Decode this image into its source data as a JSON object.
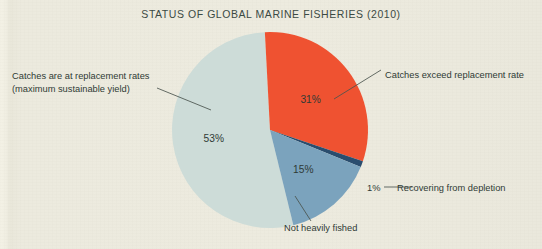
{
  "figure": {
    "title": "STATUS OF GLOBAL MARINE FISHERIES (2010)",
    "background_color": "#eceade",
    "text_color": "#2f3a35"
  },
  "labels": {
    "replacement_rates_line1": "Catches are at replacement rates",
    "replacement_rates_line2": "(maximum sustainable yield)",
    "exceed": "Catches exceed replacement rate",
    "recovering": "Recovering from depletion",
    "not_heavily_fished": "Not heavily fished",
    "one_percent": "1%"
  },
  "slice_values": {
    "replacement": "53%",
    "exceed": "31%",
    "not_fished": "15%",
    "recovering": "1%"
  },
  "chart_data": {
    "type": "pie",
    "title": "STATUS OF GLOBAL MARINE FISHERIES (2010)",
    "subtitle": "",
    "xlabel": "",
    "ylabel": "",
    "legend_position": "callout-labels",
    "grid": false,
    "unit": "percent",
    "total": 100,
    "categories": [
      "Catches exceed replacement rate",
      "Recovering from depletion",
      "Not heavily fished",
      "Catches are at replacement rates (maximum sustainable yield)"
    ],
    "values": [
      31,
      1,
      15,
      53
    ],
    "data_labels": [
      "31%",
      "1%",
      "15%",
      "53%"
    ],
    "colors": [
      "#ef5231",
      "#2a4d6e",
      "#7ba3bd",
      "#cddcd8"
    ],
    "start_angle_deg": -3,
    "direction": "clockwise",
    "slices": [
      {
        "label": "Catches exceed replacement rate",
        "value": 31,
        "display": "31%",
        "color": "#ef5231",
        "label_position": "right"
      },
      {
        "label": "Recovering from depletion",
        "value": 1,
        "display": "1%",
        "color": "#2a4d6e",
        "label_position": "right-bottom"
      },
      {
        "label": "Not heavily fished",
        "value": 15,
        "display": "15%",
        "color": "#7ba3bd",
        "label_position": "bottom"
      },
      {
        "label": "Catches are at replacement rates (maximum sustainable yield)",
        "value": 53,
        "display": "53%",
        "color": "#cddcd8",
        "label_position": "left"
      }
    ]
  }
}
